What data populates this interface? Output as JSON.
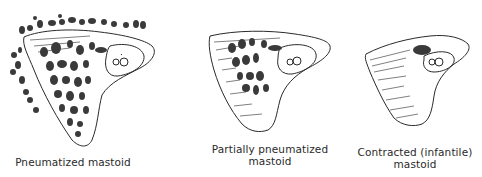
{
  "figure": {
    "panels": [
      {
        "id": "pneumatized",
        "caption": "Pneumatized mastoid",
        "caption_lines": [
          "Pneumatized mastoid"
        ]
      },
      {
        "id": "partially-pneumatized",
        "caption": "Partially pneumatized mastoid",
        "caption_lines": [
          "Partially pneumatized",
          "mastoid"
        ]
      },
      {
        "id": "contracted",
        "caption": "Contracted (infantile) mastoid",
        "caption_lines": [
          "Contracted (infantile)",
          "mastoid"
        ]
      }
    ],
    "colors": {
      "ink": "#2a2a2a",
      "background": "#ffffff"
    }
  }
}
